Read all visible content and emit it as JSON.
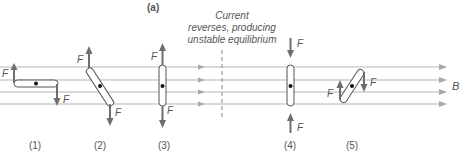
{
  "panel_label": "(a)",
  "annotation": {
    "lines": [
      "Current",
      "reverses, producing",
      "unstable equilibrium"
    ]
  },
  "field_label": "B",
  "force_label": "F",
  "positions": [
    {
      "id": "1",
      "label": "(1)"
    },
    {
      "id": "2",
      "label": "(2)"
    },
    {
      "id": "3",
      "label": "(3)"
    },
    {
      "id": "4",
      "label": "(4)"
    },
    {
      "id": "5",
      "label": "(5)"
    }
  ],
  "colors": {
    "field_line": "#b0b0b0",
    "force_arrow": "#6e6e6e",
    "text": "#555555",
    "coil": "#555555"
  }
}
